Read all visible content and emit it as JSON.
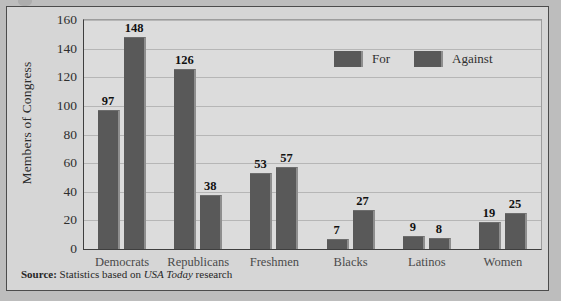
{
  "chart_data": {
    "type": "bar",
    "title": "",
    "xlabel": "",
    "ylabel": "Members of Congress",
    "ylim": [
      0,
      160
    ],
    "ytick_step": 20,
    "yticks": [
      160,
      140,
      120,
      100,
      80,
      60,
      40,
      20,
      0
    ],
    "grid": true,
    "legend_position": "top-right",
    "categories": [
      "Democrats",
      "Republicans",
      "Freshmen",
      "Blacks",
      "Latinos",
      "Women"
    ],
    "series": [
      {
        "name": "For",
        "values": [
          97,
          126,
          53,
          7,
          9,
          19
        ],
        "color": "#595959"
      },
      {
        "name": "Against",
        "values": [
          148,
          38,
          57,
          27,
          8,
          25
        ],
        "color": "#595959"
      }
    ]
  },
  "legend": {
    "items": [
      {
        "label": "For"
      },
      {
        "label": "Against"
      }
    ]
  },
  "source": {
    "label": "Source:",
    "text_before": "Statistics based on",
    "publication": "USA Today",
    "text_after": "research"
  },
  "colors": {
    "bar": "#595959",
    "bar_highlight": "#8e8e8e",
    "plot_background": "#dcdcdc",
    "figure_background": "#d6d6d6",
    "page_background": "#bdbdbd",
    "axis": "#3f3f3f",
    "gridline": "#b6b6b6"
  }
}
